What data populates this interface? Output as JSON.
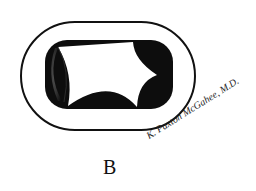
{
  "figure": {
    "label": "B",
    "signature": "K. Paxton McGahee, M.D.",
    "colors": {
      "ink": "#111111",
      "background": "#ffffff"
    }
  }
}
